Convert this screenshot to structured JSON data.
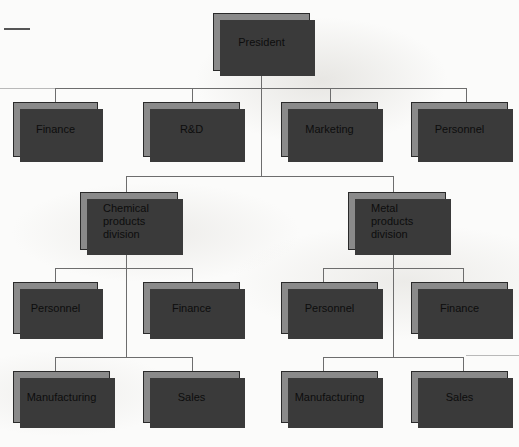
{
  "diagram": {
    "type": "org-chart",
    "colors": {
      "box_fill": "#8a8a8a",
      "box_border": "#2a2a2a",
      "box_shadow": "#3a3a3a",
      "connector": "#6d6d6d",
      "background": "#fbfbfa",
      "text": "#0d0d0d"
    },
    "levels": [
      {
        "level": 1,
        "name": "executive"
      },
      {
        "level": 2,
        "name": "corporate-functions"
      },
      {
        "level": 3,
        "name": "divisions"
      },
      {
        "level": 4,
        "name": "division-functions"
      },
      {
        "level": 5,
        "name": "division-operations"
      }
    ],
    "nodes": [
      {
        "id": "president",
        "label": "President",
        "level": 1,
        "parent": null
      },
      {
        "id": "finance-corp",
        "label": "Finance",
        "level": 2,
        "parent": "president"
      },
      {
        "id": "rnd-corp",
        "label": "R&D",
        "level": 2,
        "parent": "president"
      },
      {
        "id": "marketing-corp",
        "label": "Marketing",
        "level": 2,
        "parent": "president"
      },
      {
        "id": "personnel-corp",
        "label": "Personnel",
        "level": 2,
        "parent": "president"
      },
      {
        "id": "chemical-division",
        "label": "Chemical\nproducts\ndivision",
        "level": 3,
        "parent": "president"
      },
      {
        "id": "metal-division",
        "label": "Metal\nproducts\ndivision",
        "level": 3,
        "parent": "president"
      },
      {
        "id": "chem-personnel",
        "label": "Personnel",
        "level": 4,
        "parent": "chemical-division"
      },
      {
        "id": "chem-finance",
        "label": "Finance",
        "level": 4,
        "parent": "chemical-division"
      },
      {
        "id": "metal-personnel",
        "label": "Personnel",
        "level": 4,
        "parent": "metal-division"
      },
      {
        "id": "metal-finance",
        "label": "Finance",
        "level": 4,
        "parent": "metal-division"
      },
      {
        "id": "chem-manufacturing",
        "label": "Manufacturing",
        "level": 5,
        "parent": "chemical-division"
      },
      {
        "id": "chem-sales",
        "label": "Sales",
        "level": 5,
        "parent": "chemical-division"
      },
      {
        "id": "metal-manufacturing",
        "label": "Manufacturing",
        "level": 5,
        "parent": "metal-division"
      },
      {
        "id": "metal-sales",
        "label": "Sales",
        "level": 5,
        "parent": "metal-division"
      }
    ]
  }
}
